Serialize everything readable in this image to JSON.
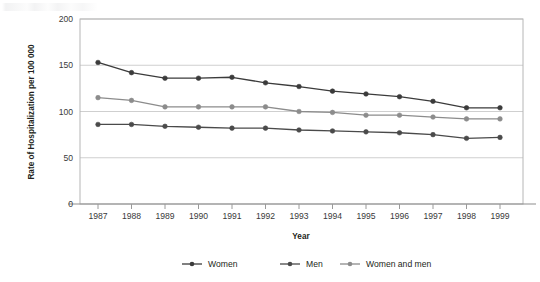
{
  "chart_data": {
    "type": "line",
    "title": "",
    "xlabel": "Year",
    "ylabel": "Rate of Hospitalization per 100 000",
    "categories": [
      "1987",
      "1988",
      "1989",
      "1990",
      "1991",
      "1992",
      "1993",
      "1994",
      "1995",
      "1996",
      "1997",
      "1998",
      "1999"
    ],
    "x": [
      1987,
      1988,
      1989,
      1990,
      1991,
      1992,
      1993,
      1994,
      1995,
      1996,
      1997,
      1998,
      1999
    ],
    "xlim": [
      1987,
      1999
    ],
    "ylim": [
      0,
      200
    ],
    "yticks": [
      0,
      50,
      100,
      150,
      200
    ],
    "ytick_labels": [
      "0",
      "50",
      "100",
      "150",
      "200"
    ],
    "grid": "horizontal",
    "legend_position": "bottom",
    "series": [
      {
        "name": "Women",
        "color": "#3b3b3b",
        "values": [
          153,
          142,
          136,
          136,
          137,
          131,
          127,
          122,
          119,
          116,
          111,
          104,
          104
        ]
      },
      {
        "name": "Men",
        "color": "#4a4a4a",
        "values": [
          86,
          86,
          84,
          83,
          82,
          82,
          80,
          79,
          78,
          77,
          75,
          71,
          72
        ]
      },
      {
        "name": "Women and men",
        "color": "#8c8c8c",
        "values": [
          115,
          112,
          105,
          105,
          105,
          105,
          100,
          99,
          96,
          96,
          94,
          92,
          92
        ]
      }
    ]
  },
  "axes": {
    "x_title": "Year",
    "y_title": "Rate of Hospitalization per 100 000"
  },
  "legend": {
    "items": [
      {
        "label": "Women",
        "color": "#3b3b3b"
      },
      {
        "label": "Men",
        "color": "#4a4a4a"
      },
      {
        "label": "Women and men",
        "color": "#8c8c8c"
      }
    ]
  },
  "colors": {
    "background": "#ffffff",
    "gridline": "#cfcfcf",
    "frame": "#b6b6b6",
    "text": "#231f20",
    "series_women": "#3b3b3b",
    "series_men": "#4a4a4a",
    "series_both": "#8c8c8c"
  }
}
